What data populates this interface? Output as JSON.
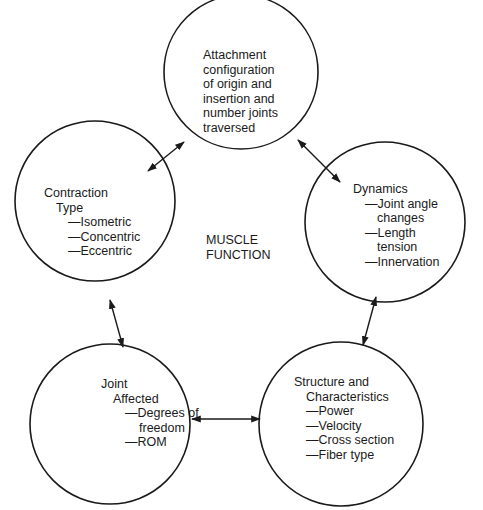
{
  "diagram": {
    "center_label": [
      "MUSCLE",
      "FUNCTION"
    ],
    "nodes": [
      {
        "id": "attachment",
        "lines": [
          "Attachment",
          "configuration",
          "of origin and",
          "insertion and",
          "number joints",
          "traversed"
        ]
      },
      {
        "id": "contraction-type",
        "title": "Contraction",
        "subtitle": "Type",
        "items": [
          "—Isometric",
          "—Concentric",
          "—Eccentric"
        ]
      },
      {
        "id": "dynamics",
        "title": "Dynamics",
        "items": [
          "—Joint angle",
          "changes",
          "—Length",
          "tension",
          "—Innervation"
        ]
      },
      {
        "id": "joint-affected",
        "title": "Joint",
        "subtitle": "Affected",
        "items": [
          "—Degrees of",
          "freedom",
          "—ROM"
        ]
      },
      {
        "id": "structure",
        "title": "Structure and",
        "subtitle": "Characteristics",
        "items": [
          "—Power",
          "—Velocity",
          "—Cross section",
          "—Fiber type"
        ]
      }
    ],
    "connections": [
      [
        "attachment",
        "contraction-type"
      ],
      [
        "attachment",
        "dynamics"
      ],
      [
        "contraction-type",
        "joint-affected"
      ],
      [
        "dynamics",
        "structure"
      ],
      [
        "joint-affected",
        "structure"
      ]
    ],
    "colors": {
      "stroke": "#1a1a1a",
      "background": "#ffffff"
    }
  }
}
